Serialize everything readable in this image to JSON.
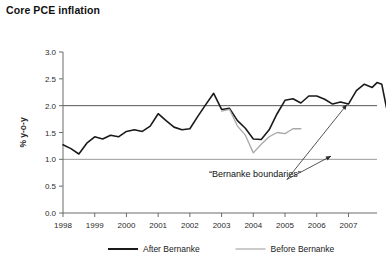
{
  "chart_data": {
    "type": "line",
    "title": "Core PCE inflation",
    "xlabel": "",
    "ylabel": "% y-o-y",
    "xlim": [
      1998.0,
      2007.9
    ],
    "ylim": [
      0.0,
      3.0
    ],
    "grid": false,
    "legend_position": "bottom-center",
    "y_ticks": [
      "0.0",
      "0.5",
      "1.0",
      "1.5",
      "2.0",
      "2.5",
      "3.0"
    ],
    "y_tick_values": [
      0.0,
      0.5,
      1.0,
      1.5,
      2.0,
      2.5,
      3.0
    ],
    "x_ticks": [
      "1998",
      "1999",
      "2000",
      "2001",
      "2002",
      "2003",
      "2004",
      "2005",
      "2006",
      "2007"
    ],
    "x_tick_values": [
      1998,
      1999,
      2000,
      2001,
      2002,
      2003,
      2004,
      2005,
      2006,
      2007
    ],
    "reference_lines": [
      {
        "name": "upper-bernanke-boundary",
        "y": 2.0,
        "color": "#555555"
      },
      {
        "name": "lower-bernanke-boundary",
        "y": 1.0,
        "color": "#9a9a9a"
      }
    ],
    "annotations": [
      {
        "name": "bernanke-boundaries-annotation",
        "text": "“Bernanke boundaries”",
        "x": 2004.05,
        "y": 0.68,
        "arrows": [
          {
            "name": "arrow-to-upper-boundary",
            "to_x": 2006.95,
            "to_y": 2.02
          },
          {
            "name": "arrow-to-lower-boundary",
            "to_x": 2006.45,
            "to_y": 1.06
          }
        ]
      }
    ],
    "series": [
      {
        "name": "After Bernanke",
        "color": "#1a1a1a",
        "width": 1.6,
        "x": [
          1998.0,
          1998.25,
          1998.5,
          1998.75,
          1999.0,
          1999.25,
          1999.5,
          1999.75,
          2000.0,
          2000.25,
          2000.5,
          2000.75,
          2001.0,
          2001.25,
          2001.5,
          2001.75,
          2002.0,
          2002.25,
          2002.5,
          2002.75,
          2003.0,
          2003.25,
          2003.5,
          2003.75,
          2004.0,
          2004.25,
          2004.5,
          2004.75,
          2005.0,
          2005.25,
          2005.5,
          2005.75,
          2006.0,
          2006.25,
          2006.5,
          2006.75,
          2007.0,
          2007.25,
          2007.5,
          2007.75
        ],
        "values": [
          1.27,
          1.2,
          1.1,
          1.3,
          1.42,
          1.38,
          1.45,
          1.42,
          1.52,
          1.55,
          1.52,
          1.62,
          1.85,
          1.72,
          1.6,
          1.55,
          1.57,
          1.8,
          2.02,
          2.23,
          1.93,
          1.95,
          1.72,
          1.58,
          1.38,
          1.37,
          1.55,
          1.85,
          2.1,
          2.13,
          2.05,
          2.18,
          2.18,
          2.12,
          2.03,
          2.07,
          2.03,
          2.28,
          2.4,
          2.34
        ],
        "extra_x": [
          2007.9,
          2008.05,
          2008.2
        ],
        "extra_values": [
          2.43,
          2.4,
          1.96
        ]
      },
      {
        "name": "Before Bernanke",
        "color": "#a8a8a8",
        "width": 1.3,
        "x": [
          2003.0,
          2003.25,
          2003.5,
          2003.75,
          2004.0,
          2004.25,
          2004.5,
          2004.75,
          2005.0,
          2005.25,
          2005.5
        ],
        "values": [
          1.9,
          1.93,
          1.62,
          1.45,
          1.12,
          1.28,
          1.42,
          1.5,
          1.48,
          1.57,
          1.57
        ]
      }
    ],
    "legend": [
      {
        "name": "After Bernanke",
        "color": "#1a1a1a"
      },
      {
        "name": "Before Bernanke",
        "color": "#a8a8a8"
      }
    ]
  }
}
